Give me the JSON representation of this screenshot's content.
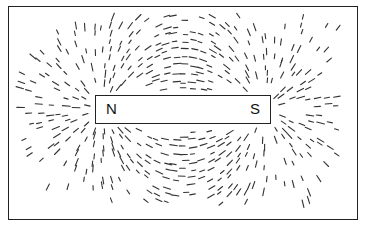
{
  "diagram": {
    "magnet": {
      "north_label": "N",
      "south_label": "S"
    },
    "colors": {
      "ink": "#222222",
      "background": "#ffffff"
    }
  }
}
